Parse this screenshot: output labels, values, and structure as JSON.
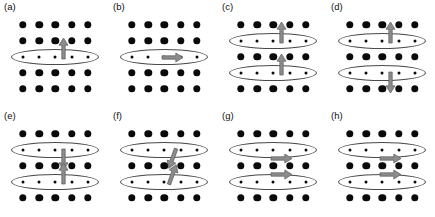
{
  "figure": {
    "width": 435,
    "height": 217,
    "background": "#ffffff",
    "dot_color": "#0a0a0a",
    "ellipse_color": "#4a4a4a",
    "arrow_color": "#8c8c8c",
    "arrow_outline": "#5a5a5a",
    "rows": 5,
    "columns": 5
  },
  "panels": [
    {
      "id": "a",
      "label": "(a)",
      "origin_x": 0,
      "origin_y": 0,
      "ellipse_rows": [
        3
      ],
      "arrows": [
        {
          "row": 3,
          "column": 3.5,
          "direction": "up",
          "angle": 0,
          "offset_y": -9
        }
      ]
    },
    {
      "id": "b",
      "label": "(b)",
      "origin_x": 109,
      "origin_y": 0,
      "ellipse_rows": [
        3
      ],
      "arrows": [
        {
          "row": 3,
          "column": 3.5,
          "direction": "right",
          "angle": 90,
          "offset_y": 0
        }
      ]
    },
    {
      "id": "c",
      "label": "(c)",
      "origin_x": 218,
      "origin_y": 0,
      "ellipse_rows": [
        2,
        4
      ],
      "arrows": [
        {
          "row": 2,
          "column": 3.5,
          "direction": "up",
          "angle": 0,
          "offset_y": -9
        },
        {
          "row": 4,
          "column": 3.5,
          "direction": "up",
          "angle": 0,
          "offset_y": -9
        }
      ]
    },
    {
      "id": "d",
      "label": "(d)",
      "origin_x": 327,
      "origin_y": 0,
      "ellipse_rows": [
        2,
        4
      ],
      "arrows": [
        {
          "row": 2,
          "column": 3.5,
          "direction": "up",
          "angle": 0,
          "offset_y": -9
        },
        {
          "row": 4,
          "column": 3.5,
          "direction": "down",
          "angle": 180,
          "offset_y": 9
        }
      ]
    },
    {
      "id": "e",
      "label": "(e)",
      "origin_x": 0,
      "origin_y": 109,
      "ellipse_rows": [
        2,
        4
      ],
      "arrows": [
        {
          "row": 2,
          "column": 3.5,
          "direction": "down",
          "angle": 180,
          "offset_y": 9
        },
        {
          "row": 4,
          "column": 3.5,
          "direction": "up",
          "angle": 0,
          "offset_y": -9
        }
      ]
    },
    {
      "id": "f",
      "label": "(f)",
      "origin_x": 109,
      "origin_y": 109,
      "ellipse_rows": [
        2,
        4
      ],
      "arrows": [
        {
          "row": 2,
          "column": 3.5,
          "direction": "down-tilted",
          "angle": 200,
          "offset_y": 8
        },
        {
          "row": 4,
          "column": 3.5,
          "direction": "up-tilted",
          "angle": 20,
          "offset_y": -8
        }
      ]
    },
    {
      "id": "g",
      "label": "(g)",
      "origin_x": 218,
      "origin_y": 109,
      "ellipse_rows": [
        2,
        4
      ],
      "arrows": [
        {
          "row": 2,
          "column": 3.5,
          "direction": "right",
          "angle": 90,
          "offset_y": 8
        },
        {
          "row": 4,
          "column": 3.5,
          "direction": "right",
          "angle": 90,
          "offset_y": -8
        }
      ]
    },
    {
      "id": "h",
      "label": "(h)",
      "origin_x": 327,
      "origin_y": 109,
      "ellipse_rows": [
        2,
        4
      ],
      "arrows": [
        {
          "row": 2,
          "column": 3.5,
          "direction": "right",
          "angle": 90,
          "offset_y": 8
        },
        {
          "row": 4,
          "column": 3.5,
          "direction": "right",
          "angle": 90,
          "offset_y": -8
        }
      ]
    }
  ],
  "geometry": {
    "first_col_x": 23,
    "col_spacing": 16.2,
    "first_row_y": 25,
    "row_spacing": 16.0,
    "ellipse_width": 88,
    "ellipse_height": 16
  }
}
